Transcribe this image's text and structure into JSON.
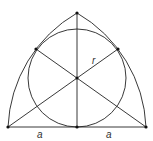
{
  "diagram": {
    "type": "geometry",
    "labels": {
      "radius": "r",
      "half_base_left": "a",
      "half_base_right": "a"
    },
    "colors": {
      "stroke": "#222222",
      "background": "#ffffff"
    }
  }
}
